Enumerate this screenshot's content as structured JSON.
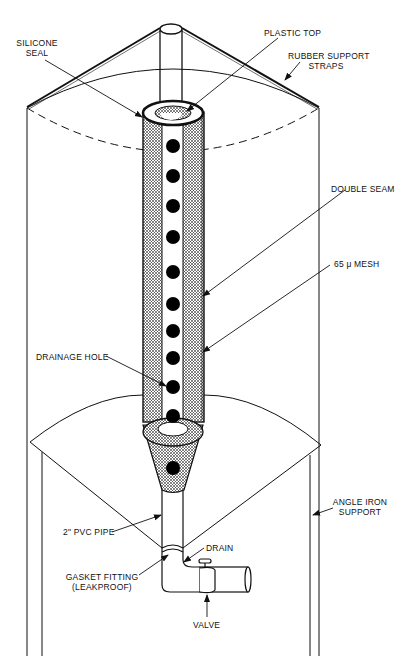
{
  "diagram": {
    "colors": {
      "line": "#111111",
      "background": "#ffffff",
      "hole": "#000000"
    },
    "labels": {
      "silicone_seal_1": "SILICONE",
      "silicone_seal_2": "SEAL",
      "plastic_top": "PLASTIC TOP",
      "rubber_straps_1": "RUBBER SUPPORT",
      "rubber_straps_2": "STRAPS",
      "double_seam": "DOUBLE SEAM",
      "mesh": "65 μ  MESH",
      "drainage_hole": "DRAINAGE HOLE",
      "angle_iron_1": "ANGLE IRON",
      "angle_iron_2": "SUPPORT",
      "pvc_pipe": "2\"  PVC PIPE",
      "drain": "DRAIN",
      "gasket_1": "GASKET FITTING",
      "gasket_2": "(LEAKPROOF)",
      "valve": "VALVE"
    },
    "drainage_hole_count": 11
  }
}
